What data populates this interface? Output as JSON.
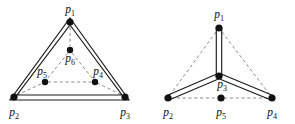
{
  "figure": {
    "title": "",
    "canvas": {
      "width": 295,
      "height": 124,
      "background": "#ffffff"
    },
    "style": {
      "solid_edge_color": "#1a1a1a",
      "dashed_edge_color": "#777777",
      "vertex_color": "#111111",
      "label_color": "#111111"
    },
    "panels": [
      {
        "id": "left-panel",
        "name": "triangle-nested-graph",
        "nodes": [
          {
            "id": "p1",
            "base": "p",
            "sub": "1",
            "x": 70,
            "y": 22,
            "r": 3.6,
            "label_x": 70,
            "label_y": 13,
            "label_anchor": "middle"
          },
          {
            "id": "p2",
            "base": "p",
            "sub": "2",
            "x": 14,
            "y": 97,
            "r": 3.6,
            "label_x": 14,
            "label_y": 116,
            "label_anchor": "middle"
          },
          {
            "id": "p3",
            "base": "p",
            "sub": "3",
            "x": 125,
            "y": 97,
            "r": 3.6,
            "label_x": 125,
            "label_y": 116,
            "label_anchor": "middle"
          },
          {
            "id": "p6",
            "base": "p",
            "sub": "6",
            "x": 70,
            "y": 50,
            "r": 3.2,
            "label_x": 70,
            "label_y": 62,
            "label_anchor": "middle"
          },
          {
            "id": "p5",
            "base": "p",
            "sub": "5",
            "x": 45,
            "y": 82,
            "r": 3.2,
            "label_x": 42,
            "label_y": 75,
            "label_anchor": "middle"
          },
          {
            "id": "p4",
            "base": "p",
            "sub": "4",
            "x": 95,
            "y": 82,
            "r": 3.2,
            "label_x": 98,
            "label_y": 75,
            "label_anchor": "middle"
          }
        ],
        "solid_edges": [
          {
            "from": "p1",
            "to": "p2",
            "style": "double-line"
          },
          {
            "from": "p1",
            "to": "p3",
            "style": "double-line"
          },
          {
            "from": "p2",
            "to": "p3",
            "style": "double-line"
          }
        ],
        "dashed_edges": [
          {
            "from": "p1",
            "to": "p6"
          },
          {
            "from": "p6",
            "to": "p5"
          },
          {
            "from": "p6",
            "to": "p4"
          },
          {
            "from": "p5",
            "to": "p4"
          },
          {
            "from": "p2",
            "to": "p5"
          },
          {
            "from": "p4",
            "to": "p3"
          }
        ]
      },
      {
        "id": "right-panel",
        "name": "star-tree-graph",
        "nodes": [
          {
            "id": "p1",
            "base": "p",
            "sub": "1",
            "x": 219,
            "y": 28,
            "r": 3.6,
            "label_x": 219,
            "label_y": 18,
            "label_anchor": "middle"
          },
          {
            "id": "p3",
            "base": "p",
            "sub": "3",
            "x": 219,
            "y": 76,
            "r": 3.6,
            "label_x": 222,
            "label_y": 88,
            "label_anchor": "middle"
          },
          {
            "id": "p2",
            "base": "p",
            "sub": "2",
            "x": 168,
            "y": 98,
            "r": 3.6,
            "label_x": 168,
            "label_y": 116,
            "label_anchor": "middle"
          },
          {
            "id": "p5",
            "base": "p",
            "sub": "5",
            "x": 221,
            "y": 98,
            "r": 3.6,
            "label_x": 221,
            "label_y": 116,
            "label_anchor": "middle"
          },
          {
            "id": "p4",
            "base": "p",
            "sub": "4",
            "x": 272,
            "y": 98,
            "r": 3.6,
            "label_x": 272,
            "label_y": 116,
            "label_anchor": "middle"
          }
        ],
        "solid_edges": [
          {
            "from": "p3",
            "to": "p1",
            "style": "double-line"
          },
          {
            "from": "p3",
            "to": "p2",
            "style": "double-line"
          },
          {
            "from": "p3",
            "to": "p4",
            "style": "double-line"
          }
        ],
        "dashed_edges": [
          {
            "from": "p1",
            "to": "p2"
          },
          {
            "from": "p1",
            "to": "p4"
          },
          {
            "from": "p2",
            "to": "p5"
          },
          {
            "from": "p5",
            "to": "p4"
          }
        ]
      }
    ]
  }
}
